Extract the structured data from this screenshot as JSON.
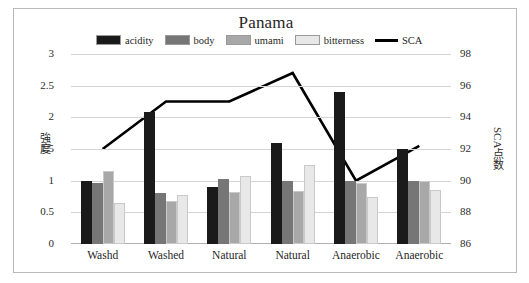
{
  "chart_data": {
    "type": "bar",
    "title": "Panama",
    "categories": [
      "Washd",
      "Washed",
      "Natural",
      "Natural",
      "Anaerobic",
      "Anaerobic"
    ],
    "series": [
      {
        "name": "acidity",
        "color": "#1a1a1a",
        "values": [
          1.0,
          2.08,
          0.9,
          1.6,
          2.4,
          1.5
        ]
      },
      {
        "name": "body",
        "color": "#767676",
        "values": [
          0.97,
          0.8,
          1.02,
          1.0,
          1.0,
          1.0
        ]
      },
      {
        "name": "umami",
        "color": "#a8a8a8",
        "values": [
          1.15,
          0.68,
          0.82,
          0.83,
          0.97,
          1.0
        ]
      },
      {
        "name": "bitterness",
        "color": "#e8e8e8",
        "values": [
          0.65,
          0.78,
          1.08,
          1.25,
          0.75,
          0.85
        ]
      }
    ],
    "line_series": {
      "name": "SCA",
      "color": "#000000",
      "values": [
        92.0,
        95.0,
        95.0,
        96.8,
        90.0,
        92.2
      ],
      "axis": "right"
    },
    "xlabel": "",
    "ylabel": "強度",
    "ylabel_right": "SCA点数",
    "ylim": [
      0,
      3
    ],
    "yticks": [
      "0",
      "0.5",
      "1",
      "1.5",
      "2",
      "2.5",
      "3"
    ],
    "ylim_right": [
      86,
      98
    ],
    "yticks_right": [
      "86",
      "88",
      "90",
      "92",
      "94",
      "96",
      "98"
    ],
    "grid": true,
    "legend_position": "top"
  },
  "legend": {
    "items": [
      {
        "label": "acidity",
        "type": "swatch",
        "color": "#1a1a1a"
      },
      {
        "label": "body",
        "type": "swatch",
        "color": "#767676"
      },
      {
        "label": "umami",
        "type": "swatch",
        "color": "#a8a8a8"
      },
      {
        "label": "bitterness",
        "type": "swatch",
        "color": "#e8e8e8"
      },
      {
        "label": "SCA",
        "type": "line",
        "color": "#000000"
      }
    ]
  }
}
